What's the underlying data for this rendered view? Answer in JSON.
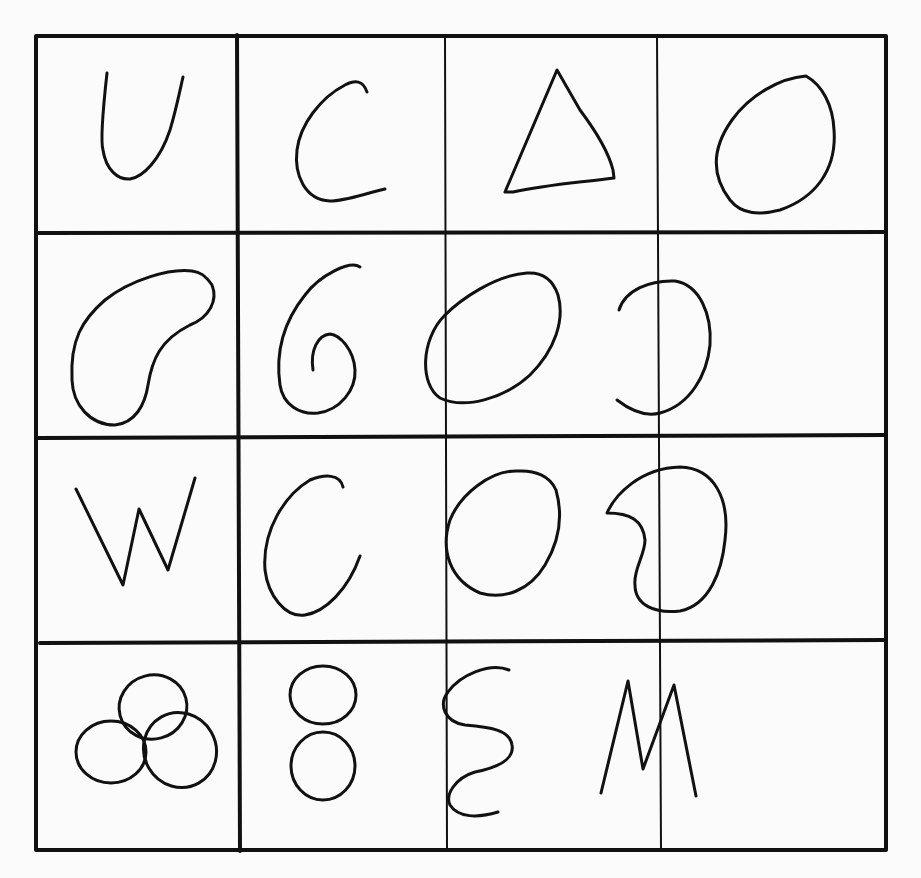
{
  "figure": {
    "rows": 4,
    "columns": 4,
    "line_color": "#111111",
    "paper_color": "#fbfbfb",
    "cells": [
      {
        "row": 1,
        "col": 1,
        "shape": "U letter"
      },
      {
        "row": 1,
        "col": 2,
        "shape": "C letter"
      },
      {
        "row": 1,
        "col": 3,
        "shape": "triangle"
      },
      {
        "row": 1,
        "col": 4,
        "shape": "oval"
      },
      {
        "row": 2,
        "col": 1,
        "shape": "bean blob"
      },
      {
        "row": 2,
        "col": 2,
        "shape": "spiral 6"
      },
      {
        "row": 2,
        "col": 3,
        "shape": "tilted ellipse"
      },
      {
        "row": 2,
        "col": 4,
        "shape": "reversed C"
      },
      {
        "row": 3,
        "col": 1,
        "shape": "W letter"
      },
      {
        "row": 3,
        "col": 2,
        "shape": "C letter"
      },
      {
        "row": 3,
        "col": 3,
        "shape": "egg oval"
      },
      {
        "row": 3,
        "col": 4,
        "shape": "kidney shape"
      },
      {
        "row": 4,
        "col": 1,
        "shape": "three overlapping circles"
      },
      {
        "row": 4,
        "col": 2,
        "shape": "figure eight"
      },
      {
        "row": 4,
        "col": 3,
        "shape": "S squiggle"
      },
      {
        "row": 4,
        "col": 4,
        "shape": "M letter"
      }
    ]
  }
}
